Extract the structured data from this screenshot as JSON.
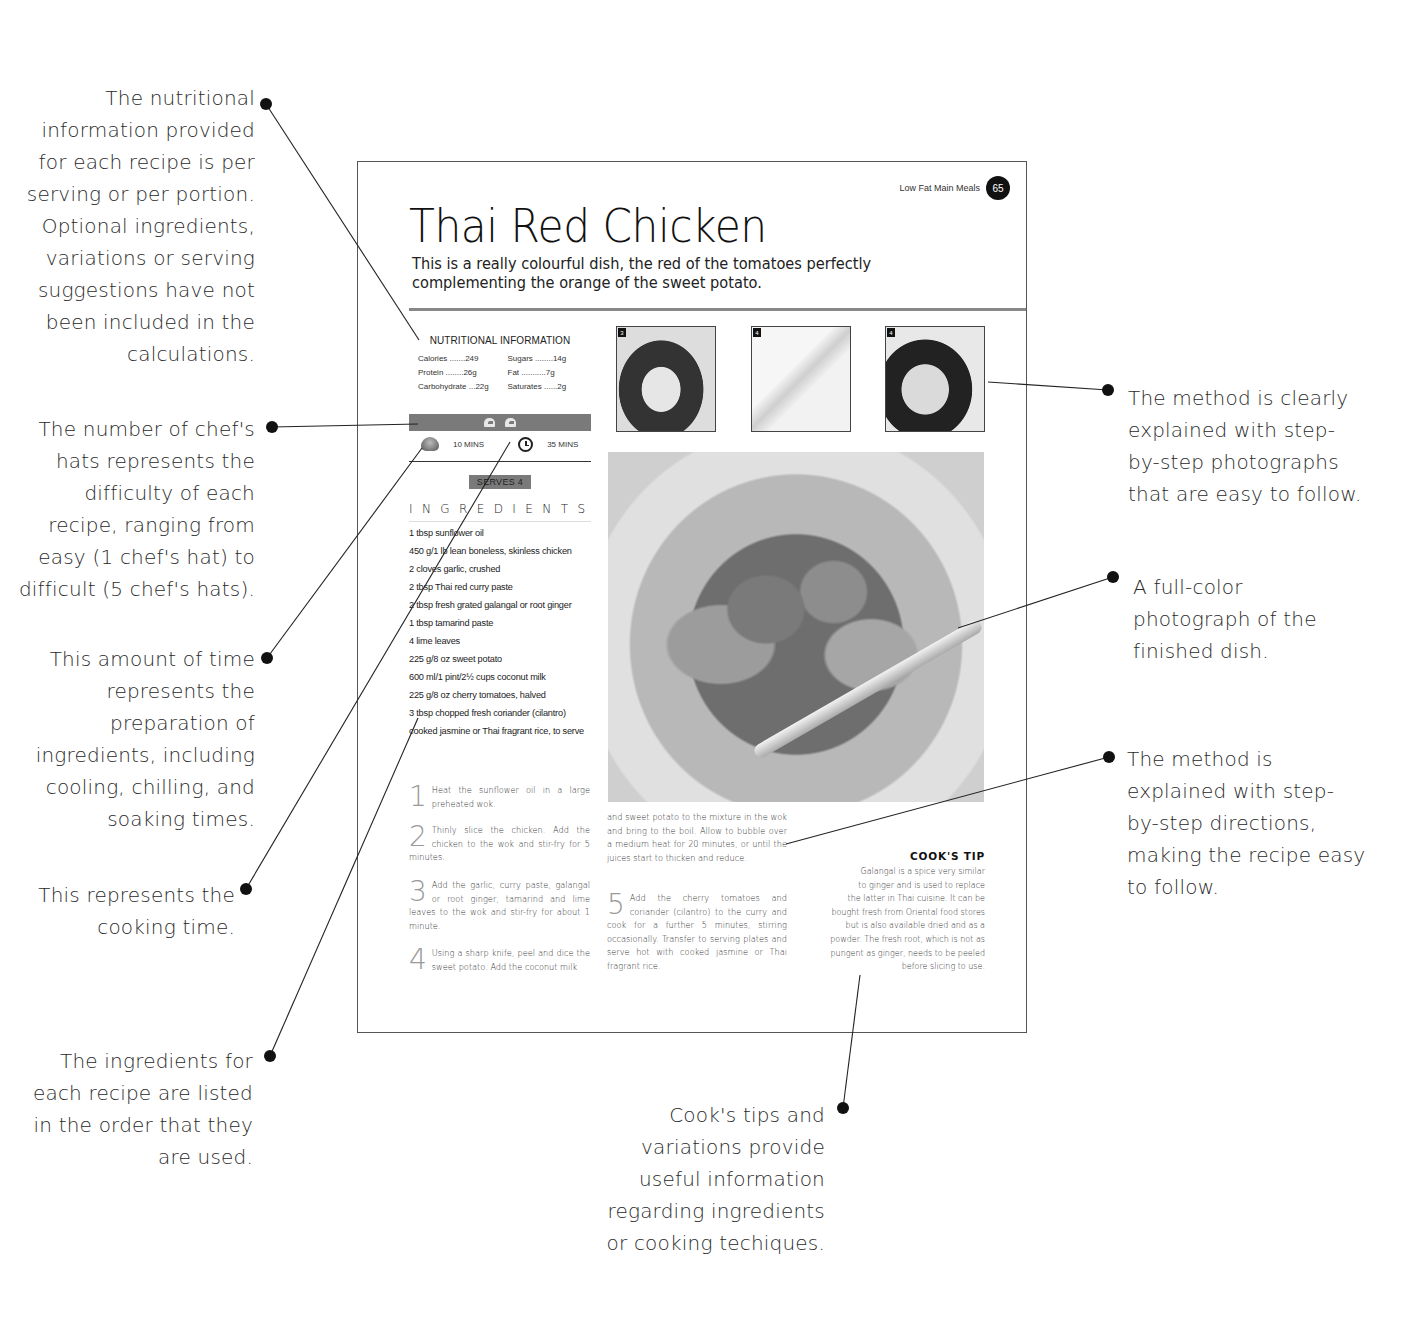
{
  "annotations": {
    "nutrition": [
      "The nutritional",
      "information provided",
      "for each recipe is per",
      "serving or per portion.",
      "Optional ingredients,",
      "variations or serving",
      "suggestions have not",
      "been included in the",
      "calculations."
    ],
    "chefs_hats": [
      "The number of chef's",
      "hats represents the",
      "difficulty of each",
      "recipe, ranging from",
      "easy (1 chef's hat) to",
      "difficult (5 chef's hats)."
    ],
    "prep_time": [
      "This amount of time",
      "represents the",
      "preparation of",
      "ingredients, including",
      "cooling, chilling, and",
      "soaking times."
    ],
    "cook_time": [
      "This represents the",
      "cooking time."
    ],
    "ingredients_order": [
      "The ingredients for",
      "each recipe are listed",
      "in the order that they",
      "are used."
    ],
    "step_photos": [
      "The method is clearly",
      "explained with step-",
      "by-step photographs",
      "that are easy to follow."
    ],
    "finished_photo": [
      "A full-color",
      "photograph of the",
      "finished dish."
    ],
    "step_directions": [
      "The method is",
      "explained with step-",
      "by-step directions,",
      "making the recipe easy",
      "to follow."
    ],
    "cooks_tips": [
      "Cook's tips and",
      "variations provide",
      "useful information",
      "regarding ingredients",
      "or cooking techiques."
    ]
  },
  "page": {
    "running_head": "Low Fat Main Meals",
    "page_number": "65",
    "title": "Thai Red Chicken",
    "intro_line1": "This is a really colourful dish, the red of the tomatoes perfectly",
    "intro_line2": "complementing the orange of the sweet potato.",
    "nutrition": {
      "heading": "NUTRITIONAL INFORMATION",
      "items": [
        {
          "label": "Calories",
          "dots": ".......",
          "value": "249"
        },
        {
          "label": "Sugars",
          "dots": "........",
          "value": "14g"
        },
        {
          "label": "Protein",
          "dots": "........",
          "value": "26g"
        },
        {
          "label": "Fat",
          "dots": "...........",
          "value": "7g"
        },
        {
          "label": "Carbohydrate",
          "dots": "...",
          "value": "22g"
        },
        {
          "label": "Saturates",
          "dots": "......",
          "value": "2g"
        }
      ]
    },
    "difficulty_hats": 2,
    "prep_time": "10 MINS",
    "cook_time": "35 MINS",
    "serves": "SERVES 4",
    "ingredients_heading": "INGREDIENTS",
    "ingredients": [
      "1 tbsp sunflower oil",
      "450 g/1 lb lean boneless, skinless chicken",
      "2 cloves garlic, crushed",
      "2 tbsp Thai red curry paste",
      "2 tbsp fresh grated galangal or root ginger",
      "1 tbsp tamarind paste",
      "4 lime leaves",
      "225 g/8 oz sweet potato",
      "600 ml/1 pint/2½ cups coconut milk",
      "225 g/8 oz cherry tomatoes, halved",
      "3 tbsp chopped fresh coriander (cilantro)",
      "cooked jasmine or Thai fragrant rice, to serve"
    ],
    "step_photos": [
      {
        "number": "3",
        "alt": "Chicken stir-frying in wok"
      },
      {
        "number": "4",
        "alt": "Dicing sweet potato with knife"
      },
      {
        "number": "4",
        "alt": "Pouring coconut milk into wok"
      }
    ],
    "steps": [
      {
        "number": "1",
        "text": "Heat the sunflower oil in a large preheated wok."
      },
      {
        "number": "2",
        "text": "Thinly slice the chicken. Add the chicken to the wok and stir-fry for 5 minutes."
      },
      {
        "number": "3",
        "text": "Add the garlic, curry paste, galangal or root ginger, tamarind and lime leaves to the wok and stir-fry for about 1 minute."
      },
      {
        "number": "4",
        "text": "Using a sharp knife, peel and dice the sweet potato. Add the coconut milk"
      },
      {
        "number": "",
        "text": "and sweet potato to the mixture in the wok and bring to the boil. Allow to bubble over a medium heat for 20 minutes, or until the juices start to thicken and reduce."
      },
      {
        "number": "5",
        "text": "Add the cherry tomatoes and coriander (cilantro) to the curry and cook for a further 5 minutes, stirring occasionally. Transfer to serving plates and serve hot with cooked jasmine or Thai fragrant rice."
      }
    ],
    "cooks_tip": {
      "title": "COOK'S TIP",
      "lines": [
        "Galangal is a spice very similar",
        "to ginger and is used to replace",
        "the latter in Thai cuisine. It can be",
        "bought fresh from Oriental food stores",
        "but is also available dried and as a",
        "powder. The fresh root, which is not as",
        "pungent as ginger, needs to be peeled",
        "before slicing to use."
      ]
    }
  },
  "colors": {
    "text": "#1a1a1a",
    "accent_bar": "#7a7a7a",
    "leader_line": "#222222"
  }
}
